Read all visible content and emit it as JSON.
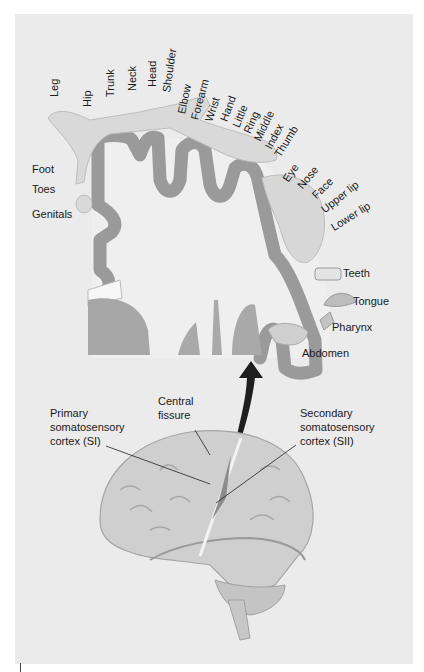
{
  "figure": {
    "colors": {
      "background": "#ebebeb",
      "cortex_gray_matter": "#9a9a9a",
      "white_matter": "#efefef",
      "homunculus_skin": "#d9d9d9",
      "arrow": "#1e1e1e",
      "brain": "#cfcfcf"
    }
  },
  "homunculus_labels": {
    "top": [
      "Leg",
      "Hip",
      "Trunk",
      "Neck",
      "Head",
      "Shoulder",
      "Elbow",
      "Forearm",
      "Wrist",
      "Hand",
      "Little",
      "Ring",
      "Middle",
      "Index",
      "Thumb"
    ],
    "face": [
      "Eye",
      "Nose",
      "Face",
      "Upper lip",
      "Lower lip"
    ],
    "left": [
      "Foot",
      "Toes",
      "Genitals"
    ],
    "right": [
      "Teeth",
      "Tongue",
      "Pharynx",
      "Abdomen"
    ]
  },
  "brain_labels": {
    "primary": [
      "Primary",
      "somatosensory",
      "cortex (SI)"
    ],
    "central": [
      "Central",
      "fissure"
    ],
    "secondary": [
      "Secondary",
      "somatosensory",
      "cortex (SII)"
    ]
  }
}
